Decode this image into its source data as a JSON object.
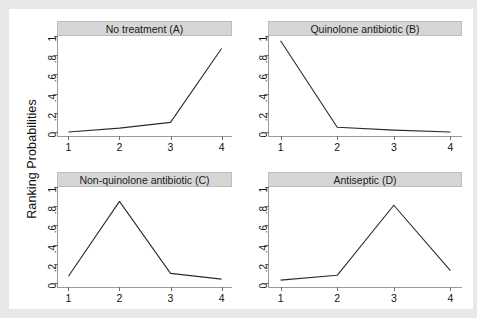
{
  "chart_data": {
    "type": "line",
    "title": "",
    "xlabel": "",
    "ylabel": "Ranking Probabilities",
    "xlim": [
      1,
      4
    ],
    "ylim": [
      0,
      1
    ],
    "x": [
      1,
      2,
      3,
      4
    ],
    "xticklabels": [
      "1",
      "2",
      "3",
      "4"
    ],
    "yticks": [
      0,
      0.2,
      0.4,
      0.6,
      0.8,
      1
    ],
    "yticklabels": [
      "0",
      ".2",
      ".4",
      ".6",
      ".8",
      "1"
    ],
    "grid": false,
    "legend": "none",
    "layout": "2x2 small multiples",
    "line_color": "#2b2b2b",
    "strip_color": "#d6d6d6",
    "panels": [
      {
        "id": "A",
        "title": "No treatment (A)",
        "values": [
          0.0,
          0.04,
          0.1,
          0.87
        ]
      },
      {
        "id": "B",
        "title": "Quinolone antibiotic (B)",
        "values": [
          0.95,
          0.05,
          0.02,
          0.0
        ]
      },
      {
        "id": "C",
        "title": "Non-quinolone antibiotic (C)",
        "values": [
          0.07,
          0.85,
          0.1,
          0.04
        ]
      },
      {
        "id": "D",
        "title": "Antiseptic (D)",
        "values": [
          0.03,
          0.08,
          0.81,
          0.13
        ]
      }
    ]
  }
}
